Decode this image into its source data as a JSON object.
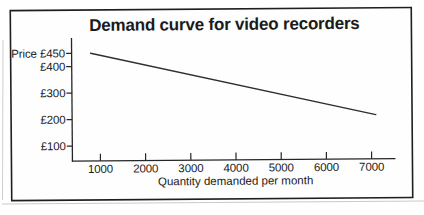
{
  "chart_data": {
    "type": "line",
    "title": "Demand curve for video recorders",
    "xlabel": "Quantity demanded per month",
    "ylabel": "Price",
    "x_ticks": [
      1000,
      2000,
      3000,
      4000,
      5000,
      6000,
      7000
    ],
    "y_ticks": [
      {
        "value": 450,
        "label": "Price £450"
      },
      {
        "value": 400,
        "label": "£400"
      },
      {
        "value": 300,
        "label": "£300"
      },
      {
        "value": 200,
        "label": "£200"
      },
      {
        "value": 100,
        "label": "£100"
      }
    ],
    "series": [
      {
        "points": [
          {
            "x": 800,
            "y": 450
          },
          {
            "x": 7100,
            "y": 210
          }
        ]
      }
    ],
    "xlim": [
      380,
      7530
    ],
    "ylim": [
      40,
      505
    ],
    "grid": false,
    "legend": false
  },
  "style": {
    "line_color": "#2e2e2e",
    "axis_color": "#262626",
    "tick_color": "#262626",
    "text_color": "#1b1b1b",
    "frame_color": "#1f1f1f",
    "scan_shadow_color": "#a8a8a8",
    "background": "#ffffff"
  }
}
